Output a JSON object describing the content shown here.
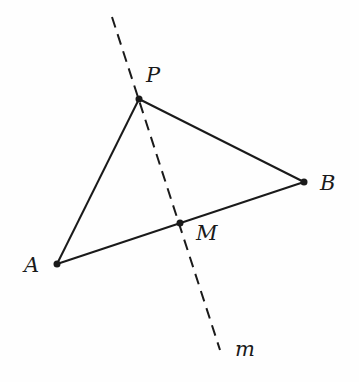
{
  "diagram": {
    "type": "geometry",
    "colors": {
      "stroke": "#1a1a1a",
      "background": "#fefefe"
    },
    "points": {
      "P": {
        "label": "P",
        "x": 139,
        "y": 99,
        "label_x": 146,
        "label_y": 82
      },
      "B": {
        "label": "B",
        "x": 304,
        "y": 182,
        "label_x": 320,
        "label_y": 190
      },
      "A": {
        "label": "A",
        "x": 57,
        "y": 264,
        "label_x": 24,
        "label_y": 272
      },
      "M": {
        "label": "M",
        "x": 180,
        "y": 223,
        "label_x": 196,
        "label_y": 240
      }
    },
    "segments": [
      {
        "name": "AP",
        "from": "A",
        "to": "P",
        "style": "solid"
      },
      {
        "name": "PB",
        "from": "P",
        "to": "B",
        "style": "solid"
      },
      {
        "name": "AB",
        "from": "A",
        "to": "B",
        "style": "solid"
      }
    ],
    "line_m": {
      "label": "m",
      "x1": 112,
      "y1": 17,
      "x2": 220,
      "y2": 350,
      "label_x": 235,
      "label_y": 356,
      "style": "dashed"
    }
  }
}
